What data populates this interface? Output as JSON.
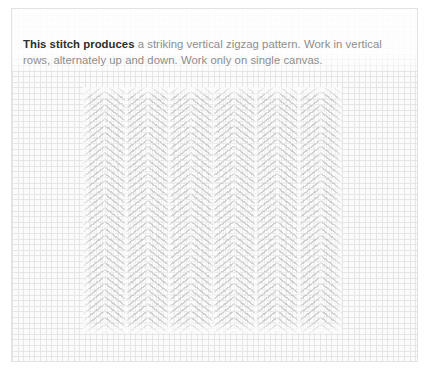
{
  "page": {
    "background_color": "#ffffff",
    "card_background_color": "#fdfdfd",
    "card_border_color": "#e2e2e2"
  },
  "caption": {
    "lead": "This stitch produces",
    "rest": " a striking vertical zigzag pattern. Work in vertical rows, alternately up and down. Work only on single canvas.",
    "lead_color": "#2e2e2e",
    "body_color": "#8d8d8d"
  },
  "swatch": {
    "label": "vertical-zigzag-stitch-sample",
    "stitch_name": "vertical zigzag stitch",
    "columns": 6,
    "yarn_color": "#969696",
    "canvas_color": "#fbfbfb",
    "mesh_line_color": "#e2e2e2",
    "mesh_cell_px": 5.6
  }
}
